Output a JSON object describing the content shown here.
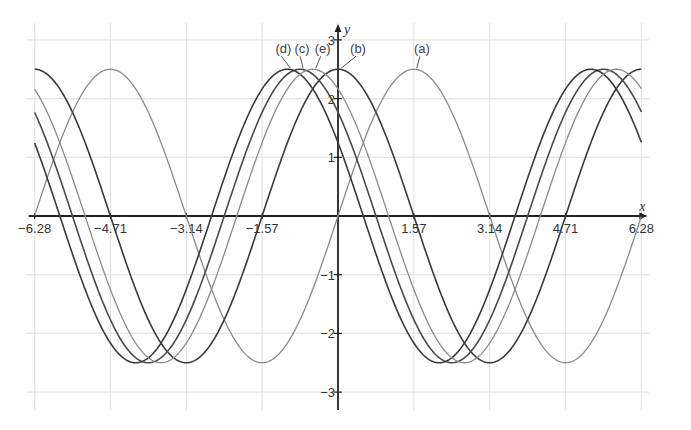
{
  "chart_data": {
    "type": "line",
    "title": "",
    "xlabel": "x",
    "ylabel": "y",
    "xlim": [
      -6.28,
      6.28
    ],
    "ylim": [
      -3,
      3
    ],
    "grid": true,
    "legend": "inline labels at peaks",
    "x_ticks": [
      -6.28,
      -4.71,
      -3.14,
      -1.57,
      1.57,
      3.14,
      4.71,
      6.28
    ],
    "x_tick_labels": [
      "−6.28",
      "−4.71",
      "−3.14",
      "−1.57",
      "1.57",
      "3.14",
      "4.71",
      "6.28"
    ],
    "y_ticks": [
      3,
      2,
      1,
      -1,
      -2,
      -3
    ],
    "y_tick_labels": [
      "3",
      "2",
      "1",
      "−1",
      "−2",
      "−3"
    ],
    "series": [
      {
        "name": "(a)",
        "formula": "2.5 sin(x)",
        "amplitude": 2.5,
        "func": "sin",
        "phase": 0,
        "peak_x": 1.57,
        "color": "#8a8a8a",
        "width": 1.3
      },
      {
        "name": "(b)",
        "formula": "2.5 cos(x)",
        "amplitude": 2.5,
        "func": "cos",
        "phase": 0,
        "peak_x": 0,
        "color": "#3a3a3a",
        "width": 1.6
      },
      {
        "name": "(c)",
        "formula": "2.5 cos(x + π/4)",
        "amplitude": 2.5,
        "func": "cos",
        "phase": 0.785,
        "peak_x": -0.785,
        "color": "#4a4a4a",
        "width": 1.6
      },
      {
        "name": "(d)",
        "formula": "2.5 cos(x + π/3)",
        "amplitude": 2.5,
        "func": "cos",
        "phase": 1.047,
        "peak_x": -1.047,
        "color": "#3a3a3a",
        "width": 1.6
      },
      {
        "name": "(e)",
        "formula": "2.5 cos(x + π/6)",
        "amplitude": 2.5,
        "func": "cos",
        "phase": 0.524,
        "peak_x": -0.524,
        "color": "#8a8a8a",
        "width": 1.3
      }
    ]
  },
  "layout": {
    "origin_px": [
      338,
      216
    ],
    "x_px_per_unit": 48.3,
    "y_px_per_unit": 58.7,
    "grid_color": "#e4e4e4",
    "axis_color": "#222222"
  }
}
